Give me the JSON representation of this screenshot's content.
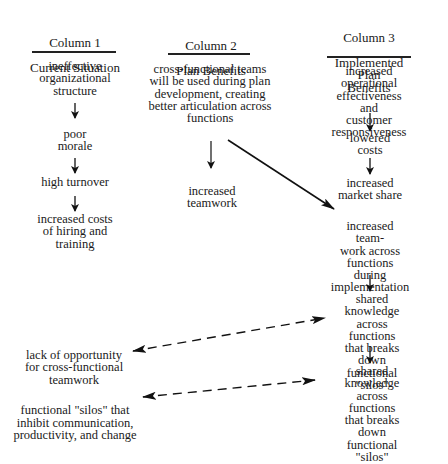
{
  "columns": [
    {
      "header_line1": "Column 1",
      "header_line2": "Current Situation",
      "items": [
        "ineffective\norganizational\nstructure",
        "poor\nmorale",
        "high turnover",
        "increased costs\nof hiring and\ntraining"
      ]
    },
    {
      "header_line1": "Column 2",
      "header_line2": "Plan Benefits",
      "items": [
        "cross-functional teams\nwill be used during plan\ndevelopment, creating\nbetter articulation across\nfunctions",
        "increased\nteamwork"
      ]
    },
    {
      "header_line1": "Column 3",
      "header_line2": "Implemented Plan\nBenefits",
      "items": [
        "increased operational\neffectiveness and\ncustomer\nresponsiveness",
        "lowered\ncosts",
        "increased\nmarket share",
        "increased team-\nwork across\nfunctions during\nimplementation",
        "shared knowledge\nacross functions\nthat breaks down\nfunctional \"silos\"",
        "shared knowledge\nacross functions\nthat breaks down\nfunctional \"silos\""
      ]
    }
  ],
  "problems": [
    "lack of opportunity\nfor cross-functional\nteamwork",
    "functional \"silos\" that\ninhibit communication,\nproductivity, and change"
  ],
  "connections": [
    {
      "from": "col1.item0",
      "to": "col1.item1",
      "style": "solid"
    },
    {
      "from": "col1.item1",
      "to": "col1.item2",
      "style": "solid"
    },
    {
      "from": "col1.item2",
      "to": "col1.item3",
      "style": "solid"
    },
    {
      "from": "col2.item0",
      "to": "col2.item1",
      "style": "solid"
    },
    {
      "from": "col2.item0",
      "to": "col3.item3",
      "style": "solid"
    },
    {
      "from": "col3.item0",
      "to": "col3.item1",
      "style": "solid"
    },
    {
      "from": "col3.item1",
      "to": "col3.item2",
      "style": "solid"
    },
    {
      "from": "col3.item3",
      "to": "col3.item4",
      "style": "solid"
    },
    {
      "from": "col3.item4",
      "to": "col3.item5",
      "style": "solid"
    },
    {
      "between": [
        "problems.0",
        "col3.item4"
      ],
      "style": "dashed",
      "bidirectional": true
    },
    {
      "between": [
        "problems.1",
        "col3.item5"
      ],
      "style": "dashed",
      "bidirectional": true
    }
  ],
  "colors": {
    "text": "#1a1a1a",
    "line": "#222222",
    "background": "#ffffff"
  }
}
